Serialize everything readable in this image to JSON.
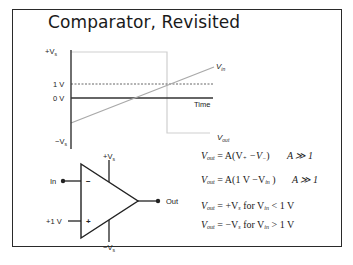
{
  "slide": {
    "title": "Comparator, Revisited"
  },
  "plot": {
    "y_labels": {
      "plus_vs": "+V",
      "plus_vs_sub": "s",
      "one_v": "1 V",
      "zero_v": "0 V",
      "minus_vs": "−V",
      "minus_vs_sub": "s"
    },
    "x_label": "Time",
    "series": {
      "vin": {
        "label": "V",
        "sub": "in",
        "color": "#a9a9a9"
      },
      "vout": {
        "label": "V",
        "sub": "out",
        "color": "#c8c8c8"
      }
    },
    "threshold_line_style": "dashed"
  },
  "circuit": {
    "input_label": "In",
    "ref_label": "+1 V",
    "output_label": "Out",
    "inverting_sign": "−",
    "noninverting_sign": "+",
    "supply_pos": "+V",
    "supply_pos_sub": "s",
    "supply_neg": "−V",
    "supply_neg_sub": "s"
  },
  "equations": [
    {
      "lhs": "V",
      "lhs_sub": "out",
      "rhs": "= A(V",
      "rhs_sub1": "+",
      "mid": " −V",
      "rhs_sub2": "−",
      "end": ")",
      "cond": "A ≫ 1"
    },
    {
      "lhs": "V",
      "lhs_sub": "out",
      "rhs": "= A(1 V −V",
      "rhs_sub1": "in",
      "end": " )",
      "cond": "A ≫ 1"
    },
    {
      "lhs": "V",
      "lhs_sub": "out",
      "rhs": "= +V",
      "rhs_sub1": "s",
      "mid": " for V",
      "rhs_sub2": "in",
      "end": " < 1 V"
    },
    {
      "lhs": "V",
      "lhs_sub": "out",
      "rhs": "= −V",
      "rhs_sub1": "s",
      "mid": " for V",
      "rhs_sub2": "in",
      "end": " > 1 V"
    }
  ]
}
